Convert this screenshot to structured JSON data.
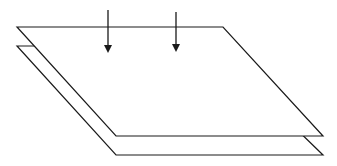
{
  "diagram": {
    "stroke_color": "#1a1a1a",
    "fill_color": "#ffffff",
    "background": "#ffffff",
    "planes": [
      {
        "name": "lower-plane",
        "points": "17,46 211,46 323,155 116,155"
      },
      {
        "name": "upper-plane",
        "points": "17,27 223,27 323,136 116,136"
      }
    ],
    "arrows": [
      {
        "name": "arrow-left",
        "x": 108,
        "y1": 10,
        "y2": 53
      },
      {
        "name": "arrow-right",
        "x": 176,
        "y1": 12,
        "y2": 52
      }
    ]
  }
}
